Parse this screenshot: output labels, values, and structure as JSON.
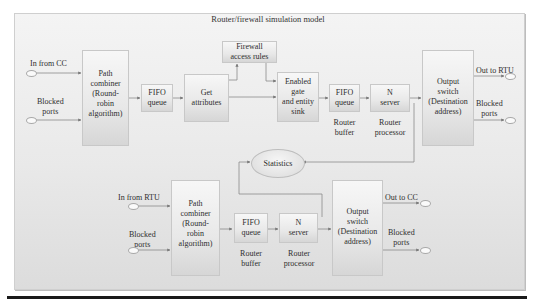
{
  "diagram": {
    "title": "Router/firewall simulation model",
    "upper": {
      "inputs": [
        {
          "label": "In from CC"
        },
        {
          "label": "Blocked\nports"
        }
      ],
      "path_combiner": "Path\ncombiner\n(Round-\nrobin\nalgorithm)",
      "fifo_queue": "FIFO\nqueue",
      "get_attributes": "Get\nattributes",
      "firewall_rules": "Firewall\naccess rules",
      "enabled_gate": "Enabled\ngate\nand entity\nsink",
      "router_fifo": "FIFO\nqueue",
      "router_fifo_caption": "Router\nbuffer",
      "n_server": "N\nserver",
      "n_server_caption": "Router\nprocessor",
      "output_switch": "Output\nswitch\n(Destination\naddress)",
      "outputs": [
        {
          "label": "Out to RTU"
        },
        {
          "label": "Blocked\nports"
        }
      ]
    },
    "statistics": "Statistics",
    "lower": {
      "inputs": [
        {
          "label": "In from RTU"
        },
        {
          "label": "Blocked\nports"
        }
      ],
      "path_combiner": "Path\ncombiner\n(Round-\nrobin\nalgorithm)",
      "router_fifo": "FIFO\nqueue",
      "router_fifo_caption": "Router\nbuffer",
      "n_server": "N\nserver",
      "n_server_caption": "Router\nprocessor",
      "output_switch": "Output\nswitch\n(Destination\naddress)",
      "outputs": [
        {
          "label": "Out to CC"
        },
        {
          "label": "Blocked\nports"
        }
      ]
    }
  }
}
